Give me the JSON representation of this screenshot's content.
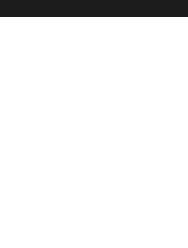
{
  "header": {
    "bar_color": "#1c1c1c"
  },
  "diagram": {
    "fret_label": "8 tr",
    "strings": 6,
    "rows": 10,
    "line_color": "#555555",
    "dot_color": "#2a2a2a",
    "markers": [
      {
        "row": 0,
        "string": 0,
        "type": "root"
      },
      {
        "row": 1,
        "string": 1,
        "type": "note"
      },
      {
        "row": 2,
        "string": 0,
        "type": "note"
      },
      {
        "row": 2,
        "string": 2,
        "type": "root"
      },
      {
        "row": 3,
        "string": 1,
        "type": "note"
      },
      {
        "row": 3,
        "string": 3,
        "type": "note"
      },
      {
        "row": 4,
        "string": 0,
        "type": "note"
      },
      {
        "row": 4,
        "string": 2,
        "type": "note"
      },
      {
        "row": 5,
        "string": 1,
        "type": "note"
      },
      {
        "row": 5,
        "string": 3,
        "type": "note"
      },
      {
        "row": 5,
        "string": 4,
        "type": "root"
      },
      {
        "row": 6,
        "string": 2,
        "type": "note"
      },
      {
        "row": 6,
        "string": 5,
        "type": "note"
      },
      {
        "row": 7,
        "string": 3,
        "type": "note"
      },
      {
        "row": 7,
        "string": 4,
        "type": "note"
      },
      {
        "row": 8,
        "string": 5,
        "type": "note"
      },
      {
        "row": 9,
        "string": 4,
        "type": "note"
      }
    ]
  }
}
